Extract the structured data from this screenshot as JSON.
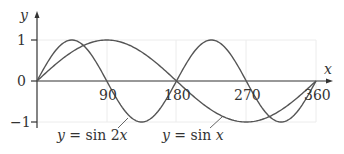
{
  "chart_data": {
    "type": "line",
    "title": "",
    "xlabel": "x",
    "ylabel": "y",
    "x_ticks": [
      "90",
      "180",
      "270",
      "360"
    ],
    "y_ticks": [
      "1",
      "0",
      "−1"
    ],
    "xlim": [
      0,
      360
    ],
    "ylim": [
      -1,
      1
    ],
    "grid": true,
    "series": [
      {
        "name": "y = sin x",
        "function": "sin(x)",
        "x": [
          0,
          90,
          180,
          270,
          360
        ],
        "values": [
          0,
          1,
          0,
          -1,
          0
        ]
      },
      {
        "name": "y = sin 2x",
        "function": "sin(2x)",
        "x": [
          0,
          45,
          90,
          135,
          180,
          225,
          270,
          315,
          360
        ],
        "values": [
          0,
          1,
          0,
          -1,
          0,
          1,
          0,
          -1,
          0
        ]
      }
    ],
    "annotations": [
      {
        "text": "y = sin 2x",
        "points_to": "sin 2x curve near x=120"
      },
      {
        "text": "y = sin x",
        "points_to": "sin x curve near x=200"
      }
    ]
  },
  "labels": {
    "y_axis": "y",
    "x_axis": "x",
    "tick_y_1": "1",
    "tick_y_0": "0",
    "tick_y_m1": "−1",
    "tick_x_90": "90",
    "tick_x_180": "180",
    "tick_x_270": "270",
    "tick_x_360": "360",
    "sin2x_label_y": "y",
    "sin2x_label_rest": " = sin 2",
    "sin2x_label_x": "x",
    "sinx_label_y": "y",
    "sinx_label_rest": " = sin ",
    "sinx_label_x": "x"
  },
  "colors": {
    "curve": "#555555",
    "axis": "#333333",
    "grid": "#eeeeee"
  }
}
